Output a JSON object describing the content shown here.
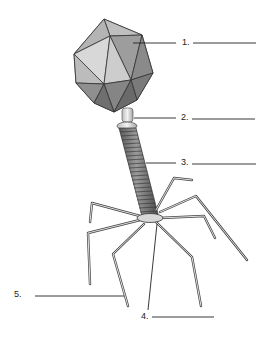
{
  "diagram": {
    "labels": [
      {
        "number": "1.",
        "blank": ""
      },
      {
        "number": "2.",
        "blank": ""
      },
      {
        "number": "3.",
        "blank": ""
      },
      {
        "number": "4.",
        "blank": ""
      },
      {
        "number": "5.",
        "blank": ""
      }
    ],
    "colors": {
      "ink": "#222222",
      "head_light": "#d6d6d6",
      "head_mid": "#a9a9a9",
      "head_dark": "#777777",
      "tail": "#6e6e6e",
      "background": "#ffffff"
    }
  }
}
